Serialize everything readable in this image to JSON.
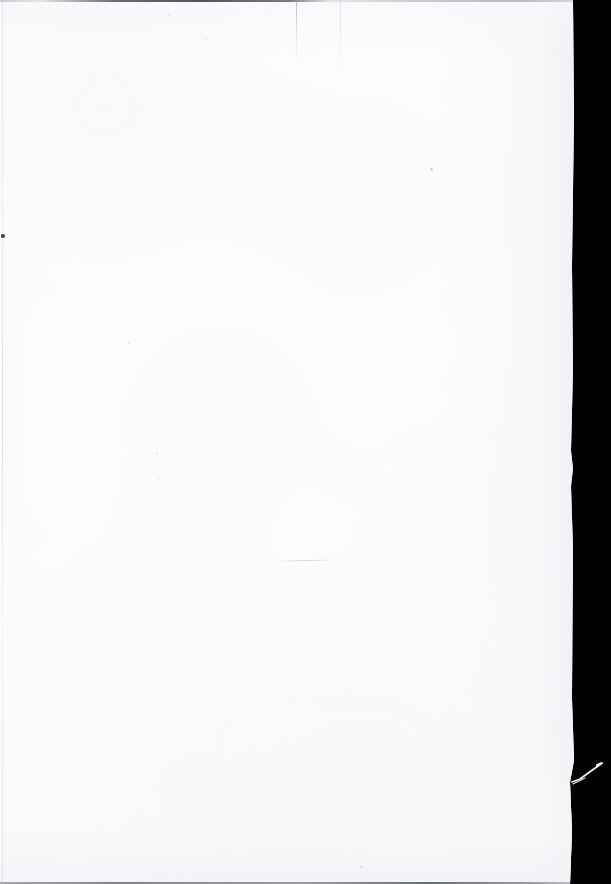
{
  "document": {
    "kind": "scanned-page",
    "page_content": "",
    "page_description": "Blank scanned page",
    "canvas": {
      "width": 611,
      "height": 884
    }
  },
  "colors": {
    "paper": "#fdfdfe",
    "paper_shadow": "#eeeff3",
    "scanner_void": "#000000",
    "edge_line": "#46484f",
    "speck": "#2d2f36",
    "fiber": "#f2f2f4"
  },
  "page": {
    "left": 0,
    "top": 0,
    "right_edge_top": 573,
    "right_edge_bottom": 570,
    "height": 884
  },
  "void": {
    "label": "scanner-void",
    "left": 570,
    "width": 41
  },
  "artifacts": {
    "top_edge_line": {
      "name": "top-edge-line",
      "y": 0,
      "x_start": 0,
      "x_end": 573,
      "darkest_from": 115,
      "darkest_to": 290
    },
    "bottom_edge_line": {
      "name": "bottom-edge-line",
      "y": 882,
      "x_start": 0,
      "x_end": 570
    },
    "left_edge_line": {
      "name": "left-edge-line",
      "x": 2,
      "y_start": 0,
      "y_end": 884
    },
    "streaks": [
      {
        "name": "scan-streak-a",
        "x": 296,
        "y_start": 0,
        "y_end": 66
      },
      {
        "name": "scan-streak-b",
        "x": 340,
        "y_start": 0,
        "y_end": 96
      }
    ],
    "hairline": {
      "name": "fiber-hairline",
      "x_start": 280,
      "x_end": 336,
      "y": 560
    },
    "torn_fiber": {
      "name": "torn-paper-fiber",
      "from_x": 573,
      "from_y": 782,
      "to_x": 601,
      "to_y": 764
    },
    "specks": [
      {
        "name": "speck-left-edge",
        "x": 1,
        "y": 234
      },
      {
        "name": "speck-upper-right",
        "x": 430,
        "y": 168
      },
      {
        "name": "speck-mid-left",
        "x": 128,
        "y": 341
      },
      {
        "name": "speck-mid-a",
        "x": 156,
        "y": 452
      },
      {
        "name": "speck-mid-b",
        "x": 157,
        "y": 476
      },
      {
        "name": "speck-lower-mid",
        "x": 292,
        "y": 600
      },
      {
        "name": "speck-upper-mid",
        "x": 205,
        "y": 38
      },
      {
        "name": "speck-top-a",
        "x": 168,
        "y": 14
      },
      {
        "name": "speck-bottom-a",
        "x": 410,
        "y": 828
      },
      {
        "name": "speck-bottom-b",
        "x": 360,
        "y": 866
      }
    ]
  }
}
